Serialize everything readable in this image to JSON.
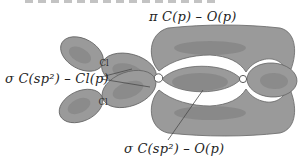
{
  "figure": {
    "labels": {
      "pi_co": "π C(p) – O(p)",
      "sigma_ccl": "σ C(sp²) – Cl(p)",
      "sigma_co": "σ C(sp²) – O(p)"
    },
    "atoms": {
      "cl_top": "Cl",
      "cl_bottom": "Cl"
    },
    "colors": {
      "orbital_fill": "#9a9a9a",
      "orbital_shade": "#7b7b7b",
      "orbital_outline": "#646464",
      "nucleus_fill": "#ffffff",
      "nucleus_outline": "#5a5a5a",
      "leader_line": "#4a4a4a",
      "label_text": "#1f1f1f",
      "atom_text": "#2e2e2e"
    }
  }
}
